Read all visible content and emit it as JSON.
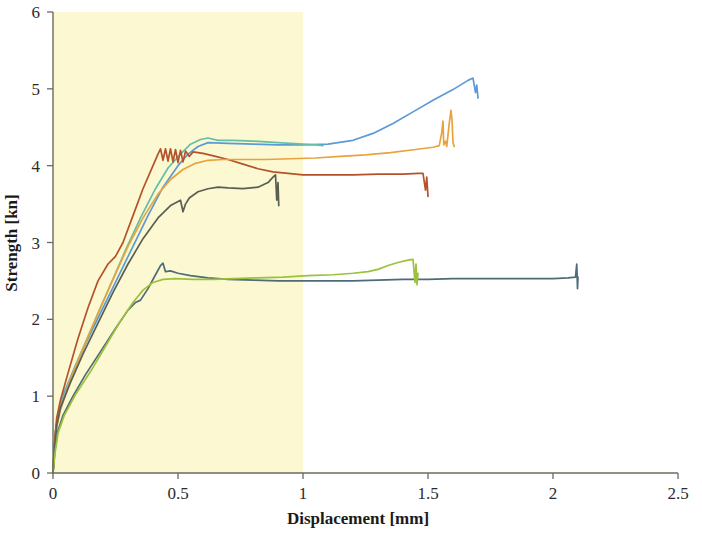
{
  "chart_data": {
    "type": "line",
    "title": "",
    "xlabel": "Displacement [mm]",
    "ylabel": "Strength [kn]",
    "xlim": [
      0,
      2.5
    ],
    "ylim": [
      0,
      6
    ],
    "xticks": [
      "0",
      "0.5",
      "1",
      "1.5",
      "2",
      "2.5"
    ],
    "xtick_values": [
      0,
      0.5,
      1,
      1.5,
      2,
      2.5
    ],
    "yticks": [
      "0",
      "1",
      "2",
      "3",
      "4",
      "5",
      "6"
    ],
    "ytick_values": [
      0,
      1,
      2,
      3,
      4,
      5,
      6
    ],
    "grid": false,
    "legend": "none",
    "background_color": "#ffffff",
    "highlight_band": {
      "name": "yellow-shaded-region",
      "x_start": 0,
      "x_end": 1.0,
      "y_start": 0,
      "y_end": 6,
      "color": "#fbf8d2"
    },
    "series": [
      {
        "name": "specimen-1-light-blue",
        "color": "#5b9bd5",
        "points": [
          [
            0.0,
            0.0
          ],
          [
            0.004,
            0.25
          ],
          [
            0.01,
            0.55
          ],
          [
            0.02,
            0.75
          ],
          [
            0.045,
            1.05
          ],
          [
            0.09,
            1.4
          ],
          [
            0.14,
            1.75
          ],
          [
            0.2,
            2.15
          ],
          [
            0.26,
            2.55
          ],
          [
            0.32,
            2.95
          ],
          [
            0.38,
            3.35
          ],
          [
            0.44,
            3.72
          ],
          [
            0.5,
            4.0
          ],
          [
            0.54,
            4.15
          ],
          [
            0.58,
            4.25
          ],
          [
            0.62,
            4.3
          ],
          [
            0.7,
            4.29
          ],
          [
            0.8,
            4.28
          ],
          [
            0.9,
            4.27
          ],
          [
            1.0,
            4.27
          ],
          [
            1.1,
            4.28
          ],
          [
            1.2,
            4.33
          ],
          [
            1.28,
            4.42
          ],
          [
            1.36,
            4.55
          ],
          [
            1.44,
            4.7
          ],
          [
            1.52,
            4.85
          ],
          [
            1.6,
            4.99
          ],
          [
            1.66,
            5.11
          ],
          [
            1.68,
            5.14
          ],
          [
            1.69,
            4.95
          ],
          [
            1.695,
            5.05
          ],
          [
            1.7,
            4.88
          ]
        ]
      },
      {
        "name": "specimen-2-teal-green",
        "color": "#65bfa8",
        "points": [
          [
            0.0,
            0.0
          ],
          [
            0.005,
            0.3
          ],
          [
            0.012,
            0.6
          ],
          [
            0.025,
            0.82
          ],
          [
            0.06,
            1.15
          ],
          [
            0.11,
            1.55
          ],
          [
            0.17,
            2.0
          ],
          [
            0.23,
            2.45
          ],
          [
            0.29,
            2.9
          ],
          [
            0.35,
            3.32
          ],
          [
            0.41,
            3.7
          ],
          [
            0.46,
            3.97
          ],
          [
            0.51,
            4.15
          ],
          [
            0.55,
            4.28
          ],
          [
            0.59,
            4.34
          ],
          [
            0.62,
            4.36
          ],
          [
            0.66,
            4.33
          ],
          [
            0.72,
            4.33
          ],
          [
            0.8,
            4.32
          ],
          [
            0.9,
            4.3
          ],
          [
            1.0,
            4.28
          ],
          [
            1.05,
            4.27
          ],
          [
            1.08,
            4.26
          ]
        ]
      },
      {
        "name": "specimen-3-brown",
        "color": "#b5522b",
        "points": [
          [
            0.0,
            0.0
          ],
          [
            0.006,
            0.4
          ],
          [
            0.015,
            0.72
          ],
          [
            0.03,
            0.95
          ],
          [
            0.06,
            1.3
          ],
          [
            0.1,
            1.75
          ],
          [
            0.14,
            2.15
          ],
          [
            0.18,
            2.5
          ],
          [
            0.22,
            2.72
          ],
          [
            0.25,
            2.82
          ],
          [
            0.28,
            3.0
          ],
          [
            0.32,
            3.35
          ],
          [
            0.36,
            3.7
          ],
          [
            0.4,
            4.0
          ],
          [
            0.42,
            4.15
          ],
          [
            0.43,
            4.22
          ],
          [
            0.44,
            4.07
          ],
          [
            0.45,
            4.22
          ],
          [
            0.46,
            4.06
          ],
          [
            0.47,
            4.22
          ],
          [
            0.48,
            4.05
          ],
          [
            0.49,
            4.21
          ],
          [
            0.5,
            4.04
          ],
          [
            0.51,
            4.2
          ],
          [
            0.52,
            4.05
          ],
          [
            0.53,
            4.19
          ],
          [
            0.545,
            4.12
          ],
          [
            0.56,
            4.18
          ],
          [
            0.6,
            4.16
          ],
          [
            0.65,
            4.12
          ],
          [
            0.7,
            4.08
          ],
          [
            0.76,
            4.02
          ],
          [
            0.82,
            3.96
          ],
          [
            0.88,
            3.92
          ],
          [
            0.94,
            3.9
          ],
          [
            1.0,
            3.88
          ],
          [
            1.1,
            3.88
          ],
          [
            1.2,
            3.88
          ],
          [
            1.3,
            3.89
          ],
          [
            1.4,
            3.89
          ],
          [
            1.46,
            3.9
          ],
          [
            1.48,
            3.9
          ],
          [
            1.49,
            3.68
          ],
          [
            1.495,
            3.85
          ],
          [
            1.5,
            3.6
          ]
        ]
      },
      {
        "name": "specimen-4-orange",
        "color": "#e8a33d",
        "points": [
          [
            0.0,
            0.0
          ],
          [
            0.005,
            0.28
          ],
          [
            0.014,
            0.58
          ],
          [
            0.028,
            0.8
          ],
          [
            0.065,
            1.18
          ],
          [
            0.12,
            1.62
          ],
          [
            0.18,
            2.08
          ],
          [
            0.24,
            2.52
          ],
          [
            0.3,
            2.95
          ],
          [
            0.36,
            3.32
          ],
          [
            0.42,
            3.63
          ],
          [
            0.47,
            3.82
          ],
          [
            0.52,
            3.95
          ],
          [
            0.57,
            4.03
          ],
          [
            0.62,
            4.07
          ],
          [
            0.68,
            4.08
          ],
          [
            0.76,
            4.08
          ],
          [
            0.85,
            4.08
          ],
          [
            0.95,
            4.09
          ],
          [
            1.05,
            4.1
          ],
          [
            1.15,
            4.12
          ],
          [
            1.25,
            4.14
          ],
          [
            1.35,
            4.17
          ],
          [
            1.45,
            4.21
          ],
          [
            1.52,
            4.24
          ],
          [
            1.545,
            4.26
          ],
          [
            1.555,
            4.43
          ],
          [
            1.56,
            4.58
          ],
          [
            1.563,
            4.27
          ],
          [
            1.57,
            4.32
          ],
          [
            1.575,
            4.25
          ],
          [
            1.585,
            4.55
          ],
          [
            1.592,
            4.72
          ],
          [
            1.596,
            4.6
          ],
          [
            1.6,
            4.3
          ],
          [
            1.605,
            4.25
          ]
        ]
      },
      {
        "name": "specimen-5-dark-slate",
        "color": "#5a5f55",
        "points": [
          [
            0.0,
            0.0
          ],
          [
            0.006,
            0.33
          ],
          [
            0.015,
            0.62
          ],
          [
            0.03,
            0.85
          ],
          [
            0.07,
            1.18
          ],
          [
            0.12,
            1.55
          ],
          [
            0.18,
            1.95
          ],
          [
            0.24,
            2.35
          ],
          [
            0.3,
            2.72
          ],
          [
            0.36,
            3.05
          ],
          [
            0.42,
            3.32
          ],
          [
            0.47,
            3.48
          ],
          [
            0.51,
            3.55
          ],
          [
            0.52,
            3.4
          ],
          [
            0.53,
            3.5
          ],
          [
            0.545,
            3.58
          ],
          [
            0.58,
            3.66
          ],
          [
            0.62,
            3.7
          ],
          [
            0.66,
            3.72
          ],
          [
            0.7,
            3.71
          ],
          [
            0.76,
            3.7
          ],
          [
            0.82,
            3.72
          ],
          [
            0.86,
            3.78
          ],
          [
            0.88,
            3.85
          ],
          [
            0.89,
            3.88
          ],
          [
            0.895,
            3.55
          ],
          [
            0.9,
            3.78
          ],
          [
            0.903,
            3.48
          ]
        ]
      },
      {
        "name": "specimen-6-gray-blue",
        "color": "#4e6b78",
        "points": [
          [
            0.0,
            0.0
          ],
          [
            0.008,
            0.3
          ],
          [
            0.02,
            0.55
          ],
          [
            0.04,
            0.75
          ],
          [
            0.08,
            1.0
          ],
          [
            0.13,
            1.28
          ],
          [
            0.19,
            1.58
          ],
          [
            0.25,
            1.88
          ],
          [
            0.3,
            2.12
          ],
          [
            0.33,
            2.22
          ],
          [
            0.35,
            2.25
          ],
          [
            0.38,
            2.4
          ],
          [
            0.41,
            2.58
          ],
          [
            0.43,
            2.7
          ],
          [
            0.44,
            2.73
          ],
          [
            0.45,
            2.62
          ],
          [
            0.47,
            2.63
          ],
          [
            0.5,
            2.6
          ],
          [
            0.55,
            2.57
          ],
          [
            0.62,
            2.54
          ],
          [
            0.7,
            2.52
          ],
          [
            0.8,
            2.51
          ],
          [
            0.9,
            2.5
          ],
          [
            1.0,
            2.5
          ],
          [
            1.1,
            2.5
          ],
          [
            1.2,
            2.5
          ],
          [
            1.3,
            2.51
          ],
          [
            1.4,
            2.52
          ],
          [
            1.5,
            2.52
          ],
          [
            1.6,
            2.53
          ],
          [
            1.7,
            2.53
          ],
          [
            1.8,
            2.53
          ],
          [
            1.9,
            2.53
          ],
          [
            2.0,
            2.53
          ],
          [
            2.06,
            2.54
          ],
          [
            2.09,
            2.55
          ],
          [
            2.095,
            2.72
          ],
          [
            2.098,
            2.4
          ],
          [
            2.1,
            2.55
          ]
        ]
      },
      {
        "name": "specimen-7-yellow-green",
        "color": "#9cc13c",
        "points": [
          [
            0.0,
            0.0
          ],
          [
            0.008,
            0.26
          ],
          [
            0.02,
            0.52
          ],
          [
            0.045,
            0.75
          ],
          [
            0.09,
            1.02
          ],
          [
            0.15,
            1.32
          ],
          [
            0.21,
            1.65
          ],
          [
            0.27,
            1.98
          ],
          [
            0.32,
            2.22
          ],
          [
            0.36,
            2.38
          ],
          [
            0.4,
            2.48
          ],
          [
            0.44,
            2.52
          ],
          [
            0.49,
            2.53
          ],
          [
            0.56,
            2.52
          ],
          [
            0.64,
            2.52
          ],
          [
            0.72,
            2.53
          ],
          [
            0.82,
            2.54
          ],
          [
            0.92,
            2.55
          ],
          [
            1.02,
            2.57
          ],
          [
            1.12,
            2.58
          ],
          [
            1.2,
            2.6
          ],
          [
            1.26,
            2.62
          ],
          [
            1.3,
            2.65
          ],
          [
            1.34,
            2.7
          ],
          [
            1.38,
            2.74
          ],
          [
            1.42,
            2.77
          ],
          [
            1.44,
            2.78
          ],
          [
            1.448,
            2.48
          ],
          [
            1.452,
            2.72
          ],
          [
            1.456,
            2.45
          ],
          [
            1.46,
            2.6
          ]
        ]
      }
    ]
  },
  "axis": {
    "x_title": "Displacement [mm]",
    "y_title": "Strength [kn]"
  }
}
